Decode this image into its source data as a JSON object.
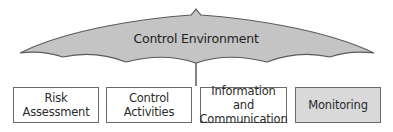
{
  "diagram": {
    "umbrella": {
      "label": "Control Environment",
      "fill": "#c4c4c4",
      "stroke": "#5a5a5a"
    },
    "components": [
      {
        "line1": "Risk",
        "line2": "Assessment",
        "shaded": false
      },
      {
        "line1": "Control",
        "line2": "Activities",
        "shaded": false
      },
      {
        "line1": "Information and",
        "line2": "Communication",
        "shaded": false
      },
      {
        "line1": "Monitoring",
        "line2": "",
        "shaded": true
      }
    ]
  }
}
